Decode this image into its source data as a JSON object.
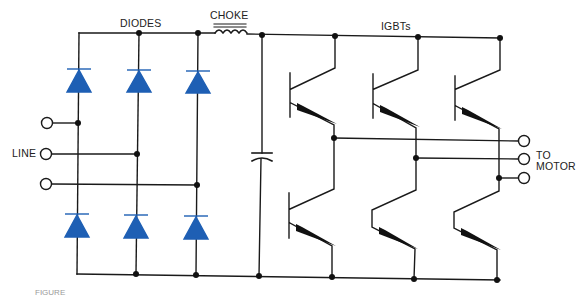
{
  "diagram": {
    "type": "circuit-schematic",
    "labels": {
      "diodes": "DIODES",
      "choke": "CHOKE",
      "igbts": "IGBTs",
      "line": "LINE",
      "to_motor_1": "TO",
      "to_motor_2": "MOTOR"
    },
    "caption_fragment": "FIGURE",
    "colors": {
      "wire": "#1a1a1a",
      "diode": "#1e5fb4",
      "node": "#111111",
      "background": "#ffffff"
    },
    "components": {
      "diode_count": 6,
      "igbt_count": 6,
      "line_terminals": 3,
      "motor_terminals": 3,
      "choke_count": 1,
      "capacitor_count": 1
    }
  }
}
